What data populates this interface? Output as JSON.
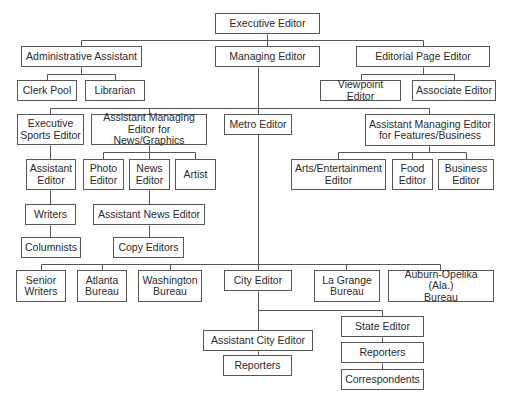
{
  "diagram": {
    "type": "org-chart",
    "line_color": "#555555",
    "box_border_color": "#555555",
    "nodes": [
      {
        "id": "exec",
        "label": "Executive Editor",
        "x": 215,
        "y": 13,
        "w": 105,
        "h": 21
      },
      {
        "id": "admin",
        "label": "Administrative Assistant",
        "x": 21,
        "y": 46,
        "w": 121,
        "h": 21
      },
      {
        "id": "managing",
        "label": "Managing Editor",
        "x": 215,
        "y": 46,
        "w": 105,
        "h": 21
      },
      {
        "id": "editorial",
        "label": "Editorial Page Editor",
        "x": 356,
        "y": 46,
        "w": 134,
        "h": 21
      },
      {
        "id": "clerk",
        "label": "Clerk Pool",
        "x": 17,
        "y": 80,
        "w": 60,
        "h": 21
      },
      {
        "id": "librarian",
        "label": "Librarian",
        "x": 85,
        "y": 80,
        "w": 60,
        "h": 21
      },
      {
        "id": "viewpoint",
        "label": "Viewpoint Editor",
        "x": 320,
        "y": 80,
        "w": 81,
        "h": 21
      },
      {
        "id": "associate",
        "label": "Associate Editor",
        "x": 412,
        "y": 80,
        "w": 84,
        "h": 21
      },
      {
        "id": "sports",
        "label": "Executive\nSports Editor",
        "x": 17,
        "y": 114,
        "w": 67,
        "h": 31
      },
      {
        "id": "ame_news",
        "label": "Assistant Managing\nEditor for News/Graphics",
        "x": 91,
        "y": 114,
        "w": 116,
        "h": 31
      },
      {
        "id": "metro",
        "label": "Metro Editor",
        "x": 224,
        "y": 114,
        "w": 68,
        "h": 21
      },
      {
        "id": "ame_feat",
        "label": "Assistant Managing Editor\nfor Features/Business",
        "x": 365,
        "y": 114,
        "w": 130,
        "h": 32
      },
      {
        "id": "asst_ed",
        "label": "Assistant\nEditor",
        "x": 26,
        "y": 159,
        "w": 50,
        "h": 31
      },
      {
        "id": "photo",
        "label": "Photo\nEditor",
        "x": 83,
        "y": 159,
        "w": 41,
        "h": 31
      },
      {
        "id": "news",
        "label": "News\nEditor",
        "x": 129,
        "y": 159,
        "w": 41,
        "h": 31
      },
      {
        "id": "artist",
        "label": "Artist",
        "x": 175,
        "y": 159,
        "w": 41,
        "h": 31
      },
      {
        "id": "arts",
        "label": "Arts/Entertainment\nEditor",
        "x": 291,
        "y": 159,
        "w": 95,
        "h": 31
      },
      {
        "id": "food",
        "label": "Food\nEditor",
        "x": 392,
        "y": 159,
        "w": 41,
        "h": 31
      },
      {
        "id": "business",
        "label": "Business\nEditor",
        "x": 438,
        "y": 159,
        "w": 56,
        "h": 31
      },
      {
        "id": "writers",
        "label": "Writers",
        "x": 25,
        "y": 204,
        "w": 51,
        "h": 21
      },
      {
        "id": "asst_news",
        "label": "Assistant News Editor",
        "x": 93,
        "y": 204,
        "w": 112,
        "h": 21
      },
      {
        "id": "columnists",
        "label": "Columnists",
        "x": 21,
        "y": 237,
        "w": 60,
        "h": 21
      },
      {
        "id": "copy",
        "label": "Copy Editors",
        "x": 113,
        "y": 237,
        "w": 71,
        "h": 21
      },
      {
        "id": "senior",
        "label": "Senior\nWriters",
        "x": 16,
        "y": 270,
        "w": 50,
        "h": 32
      },
      {
        "id": "atlanta",
        "label": "Atlanta\nBureau",
        "x": 77,
        "y": 270,
        "w": 50,
        "h": 32
      },
      {
        "id": "washington",
        "label": "Washington\nBureau",
        "x": 138,
        "y": 270,
        "w": 64,
        "h": 32
      },
      {
        "id": "city",
        "label": "City Editor",
        "x": 224,
        "y": 270,
        "w": 68,
        "h": 21
      },
      {
        "id": "lagrange",
        "label": "La Grange\nBureau",
        "x": 314,
        "y": 270,
        "w": 66,
        "h": 32
      },
      {
        "id": "auburn",
        "label": "Auburn-Opelika (Ala.)\nBureau",
        "x": 388,
        "y": 270,
        "w": 106,
        "h": 32
      },
      {
        "id": "asst_city",
        "label": "Assistant City Editor",
        "x": 203,
        "y": 330,
        "w": 110,
        "h": 21
      },
      {
        "id": "city_reporters",
        "label": "Reporters",
        "x": 223,
        "y": 355,
        "w": 69,
        "h": 21
      },
      {
        "id": "state",
        "label": "State Editor",
        "x": 341,
        "y": 316,
        "w": 83,
        "h": 21
      },
      {
        "id": "state_reporters",
        "label": "Reporters",
        "x": 341,
        "y": 342,
        "w": 83,
        "h": 21
      },
      {
        "id": "correspondents",
        "label": "Correspondents",
        "x": 341,
        "y": 369,
        "w": 83,
        "h": 21
      }
    ],
    "lines": [
      [
        267,
        34,
        267,
        46
      ],
      [
        81,
        40,
        423,
        40
      ],
      [
        81,
        40,
        81,
        46
      ],
      [
        423,
        40,
        423,
        46
      ],
      [
        81,
        67,
        81,
        74
      ],
      [
        47,
        74,
        115,
        74
      ],
      [
        47,
        74,
        47,
        80
      ],
      [
        115,
        74,
        115,
        80
      ],
      [
        423,
        67,
        423,
        74
      ],
      [
        361,
        74,
        454,
        74
      ],
      [
        361,
        74,
        361,
        80
      ],
      [
        454,
        74,
        454,
        80
      ],
      [
        258,
        67,
        258,
        270
      ],
      [
        50,
        108,
        429,
        108
      ],
      [
        50,
        108,
        50,
        114
      ],
      [
        149,
        108,
        149,
        114
      ],
      [
        429,
        108,
        429,
        114
      ],
      [
        50,
        145,
        50,
        159
      ],
      [
        50,
        190,
        50,
        204
      ],
      [
        50,
        225,
        50,
        237
      ],
      [
        149,
        145,
        149,
        152
      ],
      [
        103,
        152,
        195,
        152
      ],
      [
        103,
        152,
        103,
        159
      ],
      [
        149,
        152,
        149,
        159
      ],
      [
        195,
        152,
        195,
        159
      ],
      [
        149,
        190,
        149,
        204
      ],
      [
        149,
        225,
        149,
        237
      ],
      [
        429,
        146,
        429,
        152
      ],
      [
        338,
        152,
        466,
        152
      ],
      [
        338,
        152,
        338,
        159
      ],
      [
        412,
        152,
        412,
        159
      ],
      [
        466,
        152,
        466,
        159
      ],
      [
        41,
        264,
        440,
        264
      ],
      [
        41,
        264,
        41,
        270
      ],
      [
        102,
        264,
        102,
        270
      ],
      [
        170,
        264,
        170,
        270
      ],
      [
        346,
        264,
        346,
        270
      ],
      [
        440,
        264,
        440,
        270
      ],
      [
        258,
        291,
        258,
        330
      ],
      [
        258,
        310,
        382,
        310
      ],
      [
        382,
        310,
        382,
        316
      ],
      [
        258,
        351,
        258,
        355
      ],
      [
        382,
        337,
        382,
        342
      ],
      [
        382,
        363,
        382,
        369
      ]
    ]
  }
}
